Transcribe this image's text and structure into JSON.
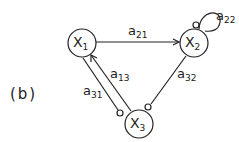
{
  "panel_label": "(b)",
  "nodes": [
    {
      "id": "X1",
      "base": "X",
      "sub": "1"
    },
    {
      "id": "X2",
      "base": "X",
      "sub": "2"
    },
    {
      "id": "X3",
      "base": "X",
      "sub": "3"
    }
  ],
  "edges": [
    {
      "label_base": "a",
      "label_sub": "21",
      "from": "X1",
      "to": "X2",
      "type": "arrow"
    },
    {
      "label_base": "a",
      "label_sub": "22",
      "from": "X2",
      "to": "X2",
      "type": "self-loop-inhibit"
    },
    {
      "label_base": "a",
      "label_sub": "13",
      "from": "X3",
      "to": "X1",
      "type": "arrow"
    },
    {
      "label_base": "a",
      "label_sub": "31",
      "from": "X1",
      "to": "X3",
      "type": "inhibit"
    },
    {
      "label_base": "a",
      "label_sub": "32",
      "from": "X2",
      "to": "X3",
      "type": "inhibit"
    }
  ]
}
